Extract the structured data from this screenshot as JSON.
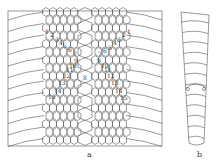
{
  "figure": {
    "panels": [
      {
        "id": "a",
        "label": "a",
        "description": "Dorsal scale pattern, ventral view with numbered scale rows"
      },
      {
        "id": "b",
        "label": "b",
        "description": "Lateral ventral scutes, tapering"
      }
    ],
    "scale_numbers_left": [
      "1",
      "2",
      "3",
      "4",
      "5",
      "6",
      "7",
      "9",
      "10",
      "11",
      "12",
      "13",
      "14",
      "15"
    ],
    "scale_numbers_right": [
      "1",
      "2",
      "3",
      "4",
      "5",
      "6",
      "7",
      "9",
      "10",
      "11",
      "12",
      "13",
      "14",
      "15"
    ],
    "center_number": "8",
    "colors": {
      "line": "#555555",
      "background": "#ffffff"
    }
  }
}
